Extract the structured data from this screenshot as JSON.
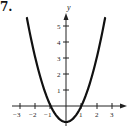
{
  "problem": {
    "number": "7."
  },
  "colors": {
    "curve": "#111111",
    "axis": "#222222",
    "background": "#ffffff"
  },
  "chart_data": {
    "type": "line",
    "title": "",
    "function": "y = x^2 - 1",
    "xlabel": "",
    "ylabel": "y",
    "xlim": [
      -3.4,
      3.9
    ],
    "ylim": [
      -1.2,
      5.9
    ],
    "xticks": [
      -3,
      -2,
      -1,
      1,
      2,
      3
    ],
    "xtick_labels": [
      "−3",
      "−2",
      "−1",
      "1",
      "2",
      "3"
    ],
    "yticks": [
      1,
      2,
      3,
      4,
      5
    ],
    "ytick_labels": [
      "1",
      "2",
      "3",
      "4",
      "5"
    ],
    "grid": false,
    "legend": null,
    "series": [
      {
        "name": "parabola",
        "x": [
          -2.55,
          -2,
          -1.5,
          -1,
          -0.5,
          0,
          0.5,
          1,
          1.5,
          2,
          2.55
        ],
        "y": [
          5.5,
          3,
          1.25,
          0,
          -0.75,
          -1,
          -0.75,
          0,
          1.25,
          3,
          5.5
        ]
      }
    ],
    "annotations": {
      "vertex": [
        0,
        -1
      ],
      "x_intercepts": [
        -1,
        1
      ]
    }
  }
}
